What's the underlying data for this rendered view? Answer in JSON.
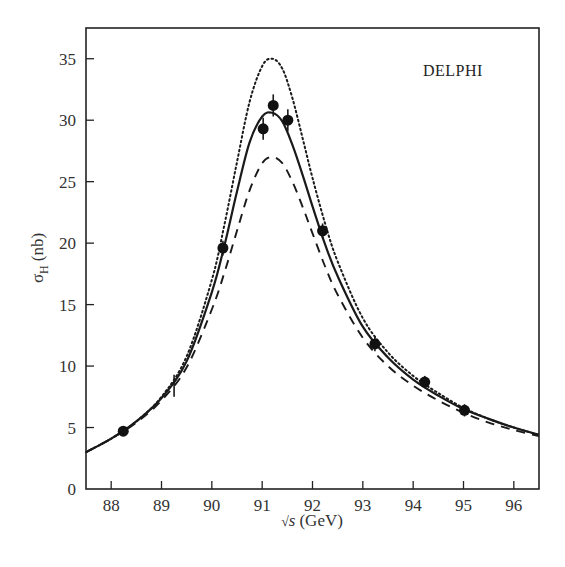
{
  "chart_data": {
    "type": "line",
    "title": "",
    "annotation": "DELPHI",
    "xlabel": "√s (GeV)",
    "ylabel": "σH (nb)",
    "ylabel_main": "σ",
    "ylabel_sub": "H",
    "ylabel_unit": "(nb)",
    "xlabel_sqrt": "√",
    "xlabel_var": "s",
    "xlabel_unit": "(GeV)",
    "xlim": [
      87.5,
      96.5
    ],
    "ylim": [
      0,
      37.5
    ],
    "xticks": [
      88,
      89,
      90,
      91,
      92,
      93,
      94,
      95,
      96
    ],
    "yticks": [
      0,
      5,
      10,
      15,
      20,
      25,
      30,
      35
    ],
    "grid": false,
    "legend": null,
    "series": [
      {
        "name": "fit (solid)",
        "style": "solid",
        "x": [
          87.5,
          88.0,
          88.5,
          89.0,
          89.5,
          90.0,
          90.25,
          90.5,
          90.75,
          91.0,
          91.2,
          91.4,
          91.6,
          91.8,
          92.0,
          92.25,
          92.5,
          93.0,
          93.5,
          94.0,
          94.5,
          95.0,
          95.5,
          96.0,
          96.5
        ],
        "y": [
          3.0,
          4.1,
          5.5,
          7.4,
          10.4,
          16.0,
          19.8,
          24.2,
          28.2,
          30.3,
          30.6,
          29.9,
          28.0,
          25.6,
          23.0,
          19.9,
          17.3,
          13.2,
          10.7,
          8.9,
          7.6,
          6.5,
          5.7,
          5.0,
          4.4
        ]
      },
      {
        "name": "dotted",
        "style": "dotted",
        "x": [
          87.5,
          88.0,
          88.5,
          89.0,
          89.5,
          90.0,
          90.25,
          90.5,
          90.75,
          91.0,
          91.2,
          91.4,
          91.6,
          91.8,
          92.0,
          92.25,
          92.5,
          93.0,
          93.5,
          94.0,
          94.5,
          95.0,
          95.5,
          96.0,
          96.5
        ],
        "y": [
          3.0,
          4.1,
          5.5,
          7.5,
          10.8,
          17.0,
          21.5,
          26.6,
          31.5,
          34.4,
          35.0,
          34.2,
          31.8,
          28.6,
          25.3,
          21.6,
          18.5,
          13.9,
          11.1,
          9.2,
          7.8,
          6.6,
          5.7,
          5.0,
          4.4
        ]
      },
      {
        "name": "dashed",
        "style": "dashed",
        "x": [
          87.5,
          88.0,
          88.5,
          89.0,
          89.5,
          90.0,
          90.25,
          90.5,
          90.75,
          91.0,
          91.2,
          91.4,
          91.6,
          91.8,
          92.0,
          92.25,
          92.5,
          93.0,
          93.5,
          94.0,
          94.5,
          95.0,
          95.5,
          96.0,
          96.5
        ],
        "y": [
          3.0,
          4.1,
          5.4,
          7.2,
          9.9,
          14.6,
          17.6,
          21.0,
          24.3,
          26.5,
          27.0,
          26.5,
          25.0,
          23.0,
          20.8,
          18.1,
          15.8,
          12.3,
          10.0,
          8.4,
          7.2,
          6.2,
          5.4,
          4.8,
          4.3
        ]
      }
    ],
    "points": {
      "name": "DELPHI data",
      "x": [
        88.24,
        89.25,
        90.22,
        91.02,
        91.22,
        91.51,
        92.2,
        93.24,
        94.23,
        95.02
      ],
      "y": [
        4.7,
        8.4,
        19.6,
        29.3,
        31.2,
        30.0,
        21.0,
        11.8,
        8.7,
        6.4
      ],
      "err": [
        0.3,
        0.9,
        0.6,
        0.9,
        0.9,
        0.9,
        0.6,
        0.6,
        0.5,
        0.5
      ],
      "marker_visible": [
        true,
        false,
        true,
        true,
        true,
        true,
        true,
        true,
        true,
        true
      ]
    }
  }
}
